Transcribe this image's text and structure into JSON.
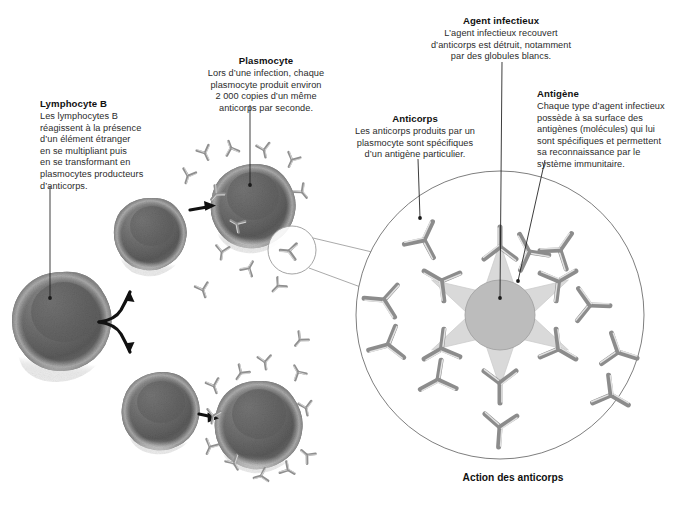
{
  "figure": {
    "caption": "Action des anticorps",
    "background": "#ffffff",
    "ink": "#1a1a1a"
  },
  "callouts": [
    {
      "id": "lymphocyte-b",
      "title": "Lymphocyte B",
      "body": "Les lymphocytes B\nréagissent à la présence\nd’un élément étranger\nen se multipliant puis\nen se transformant en\nplasmocytes producteurs\nd’anticorps.",
      "align": "left"
    },
    {
      "id": "plasmocyte",
      "title": "Plasmocyte",
      "body": "Lors d’une infection, chaque\nplasmocyte produit environ\n2 000 copies d’un même\nanticorps par seconde.",
      "align": "center"
    },
    {
      "id": "anticorps",
      "title": "Anticorps",
      "body": "Les anticorps produits par un\nplasmocyte sont spécifiques\nd’un antigène particulier.",
      "align": "center"
    },
    {
      "id": "agent-infectieux",
      "title": "Agent infectieux",
      "body": "L’agent infectieux recouvert\nd’anticorps est détruit, notamment\npar des globules blancs.",
      "align": "center"
    },
    {
      "id": "antigene",
      "title": "Antigène",
      "body": "Chaque type d’agent infectieux\npossède à sa surface des\nantigènes (molécules) qui lui\nsont spécifiques et permettent\nsa reconnaissance par le\nsystème immunitaire.",
      "align": "left"
    }
  ],
  "cells": [
    {
      "name": "lymphocyte-b-large",
      "cx": 62,
      "cy": 322,
      "r": 50,
      "role": "Lymphocyte B"
    },
    {
      "name": "lymphocyte-b-small",
      "cx": 150,
      "cy": 230,
      "r": 32,
      "role": "Lymphocyte B"
    },
    {
      "name": "plasmocyte-top",
      "cx": 250,
      "cy": 201,
      "r": 37,
      "role": "Plasmocyte"
    },
    {
      "name": "lymphocyte-b-bottom",
      "cx": 160,
      "cy": 406,
      "r": 34,
      "role": "Lymphocyte B"
    },
    {
      "name": "plasmocyte-bottom",
      "cx": 257,
      "cy": 419,
      "r": 38,
      "role": "Plasmocyte"
    }
  ],
  "antigen_complex": {
    "outer_circle": {
      "cx": 500,
      "cy": 315,
      "r": 144,
      "stroke": "#6f6f6f"
    },
    "pathogen": {
      "cx": 500,
      "cy": 315,
      "r": 35,
      "fill": "#b9b9b9",
      "stroke": "#9a9a9a"
    },
    "antigen_star": {
      "points": 6,
      "outer_r": 72,
      "fill": "#d8d8d8"
    },
    "bound_antibodies": 6,
    "free_antibodies": 6,
    "antibody_color": "#8c8c8c"
  },
  "magnifier": {
    "name": "antibody-magnifier",
    "cx": 292,
    "cy": 250,
    "r": 24,
    "stroke": "#9a9a9a"
  },
  "free_antibodies": {
    "count_top_cluster": 11,
    "count_bottom_cluster": 12,
    "color": "#8f8f8f"
  },
  "leaders": [
    {
      "name": "leader-lymphocyte-b",
      "from": "Lymphocyte B",
      "to": "lymphocyte-b-large"
    },
    {
      "name": "leader-plasmocyte",
      "from": "Plasmocyte",
      "to": "plasmocyte-top"
    },
    {
      "name": "leader-anticorps",
      "from": "Anticorps",
      "to": "free-antibody-upper-left"
    },
    {
      "name": "leader-agent",
      "from": "Agent infectieux",
      "to": "pathogen-core"
    },
    {
      "name": "leader-antigene",
      "from": "Antigène",
      "to": "antigen-spike"
    }
  ],
  "arrows": [
    {
      "name": "arrow-branch",
      "kind": "forked",
      "label": "differentiation"
    },
    {
      "name": "arrow-to-plasmo-top",
      "kind": "straight",
      "label": "transformation"
    },
    {
      "name": "arrow-to-plasmo-bot",
      "kind": "straight",
      "label": "transformation"
    }
  ]
}
